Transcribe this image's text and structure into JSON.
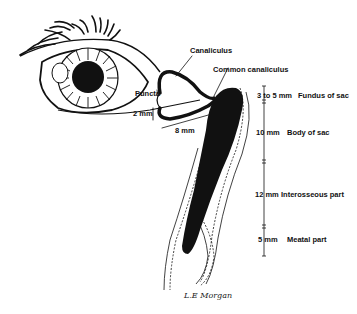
{
  "diagram": {
    "labels": {
      "canaliculus": "Canaliculus",
      "common_canaliculus": "Common canaliculus",
      "puncta": "Puncta",
      "vertical_canaliculus": "2 mm",
      "horizontal_canaliculus": "8 mm"
    },
    "segments": [
      {
        "size": "3 to 5 mm",
        "name": "Fundus of sac"
      },
      {
        "size": "10 mm",
        "name": "Body of sac"
      },
      {
        "size": "12 mm",
        "name": "Interosseous part"
      },
      {
        "size": "5 mm",
        "name": "Meatal part"
      }
    ],
    "signature": "L.E Morgan",
    "colors": {
      "ink": "#111111",
      "background": "#ffffff"
    }
  }
}
